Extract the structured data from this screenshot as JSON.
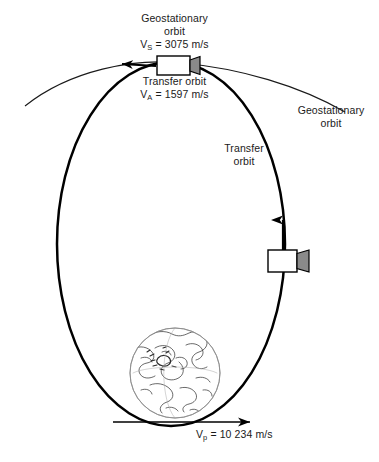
{
  "figure": {
    "background_color": "#ffffff",
    "line_color": "#000000",
    "nozzle_color": "#808080"
  },
  "labels": {
    "geostationary_orbit_top_line1": "Geostationary",
    "geostationary_orbit_top_line2": "orbit",
    "apogee_geo_velocity": "V",
    "apogee_geo_velocity_sub": "S",
    "apogee_geo_velocity_value": " = 3075 m/s",
    "transfer_orbit_top_line1": "Transfer orbit",
    "apogee_transfer_velocity": "V",
    "apogee_transfer_velocity_sub": "A",
    "apogee_transfer_velocity_value": " = 1597 m/s",
    "geostationary_orbit_right_line1": "Geostationary",
    "geostationary_orbit_right_line2": "orbit",
    "transfer_orbit_mid_line1": "Transfer",
    "transfer_orbit_mid_line2": "orbit",
    "perigee_velocity": "V",
    "perigee_velocity_sub": "p",
    "perigee_velocity_value": " = 10 234 m/s"
  },
  "objects": {
    "earth": "earth-globe",
    "satellite_apogee": "satellite-at-apogee",
    "satellite_perigee_burn": "satellite-on-transfer-orbit",
    "transfer_ellipse": "transfer-orbit-ellipse",
    "geostationary_arc": "geostationary-orbit-arc",
    "velocity_arrow_apogee": "apogee-velocity-arrow",
    "velocity_arrow_perigee": "perigee-velocity-arrow",
    "thrust_arrow": "thrust-direction-arrow"
  },
  "values": {
    "geostationary_velocity_ms": 3075,
    "transfer_apogee_velocity_ms": 1597,
    "transfer_perigee_velocity_ms": 10234
  }
}
